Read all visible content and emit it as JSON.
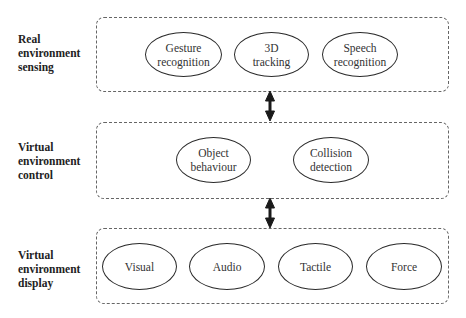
{
  "layers": [
    {
      "label_lines": [
        "Real",
        "environment",
        "sensing"
      ],
      "nodes": [
        {
          "lines": [
            "Gesture",
            "recognition"
          ]
        },
        {
          "lines": [
            "3D",
            "tracking"
          ]
        },
        {
          "lines": [
            "Speech",
            "recognition"
          ]
        }
      ]
    },
    {
      "label_lines": [
        "Virtual",
        "environment",
        "control"
      ],
      "nodes": [
        {
          "lines": [
            "Object",
            "behaviour"
          ]
        },
        {
          "lines": [
            "Collision",
            "detection"
          ]
        }
      ]
    },
    {
      "label_lines": [
        "Virtual",
        "environment",
        "display"
      ],
      "nodes": [
        {
          "lines": [
            "Visual"
          ]
        },
        {
          "lines": [
            "Audio"
          ]
        },
        {
          "lines": [
            "Tactile"
          ]
        },
        {
          "lines": [
            "Force"
          ]
        }
      ]
    }
  ],
  "connectors": [
    {
      "from": "Real environment sensing",
      "to": "Virtual environment control",
      "type": "bidirectional"
    },
    {
      "from": "Virtual environment control",
      "to": "Virtual environment display",
      "type": "bidirectional"
    }
  ],
  "colors": {
    "stroke": "#2a2a2a",
    "dashed_border": "#666666",
    "text": "#222222"
  }
}
